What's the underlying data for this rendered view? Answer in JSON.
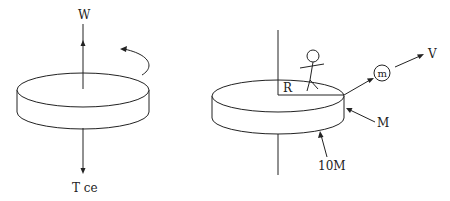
{
  "diagram": {
    "left_figure": {
      "labels": {
        "top": "W",
        "bottom": "T ce"
      },
      "elements": [
        "disk",
        "vertical-axis-up-arrow",
        "vertical-axis-down-arrow",
        "rotation-arrow"
      ]
    },
    "right_figure": {
      "labels": {
        "radius": "R",
        "mass_small": "m",
        "velocity": "V",
        "disk_rim_mass": "M",
        "disk_mass": "10M"
      },
      "elements": [
        "disk",
        "vertical-axis",
        "stick-figure-person",
        "radius-line",
        "ball-m",
        "velocity-arrow",
        "rim-pointer-arrow",
        "disk-pointer-arrow"
      ]
    }
  }
}
